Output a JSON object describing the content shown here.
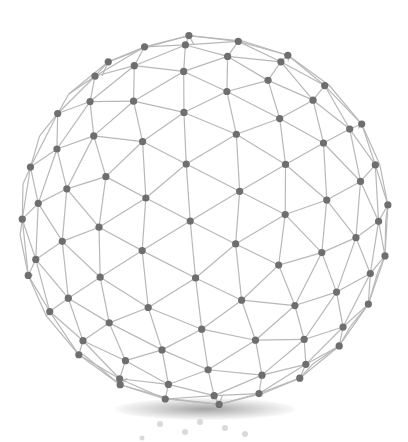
{
  "illustration": {
    "subject": "geodesic wireframe sphere",
    "colors": {
      "background": "#ffffff",
      "edge": "#b8b8b8",
      "node": "#6e6e6e",
      "shadow": "#5a5a5a"
    },
    "center": [
      204,
      220
    ],
    "radius": 185
  }
}
